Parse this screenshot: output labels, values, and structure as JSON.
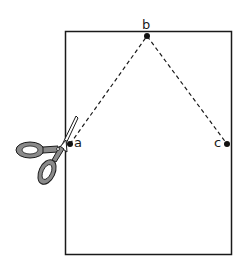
{
  "diagram": {
    "points": {
      "a": {
        "label": "a",
        "x": 70,
        "y": 144
      },
      "b": {
        "label": "b",
        "x": 147,
        "y": 36
      },
      "c": {
        "label": "c",
        "x": 227,
        "y": 144
      }
    },
    "icons": [
      "scissors-icon"
    ],
    "colors": {
      "line": "#1a1a1a",
      "scissor_handle": "#8a8a8a",
      "background": "#ffffff"
    }
  }
}
